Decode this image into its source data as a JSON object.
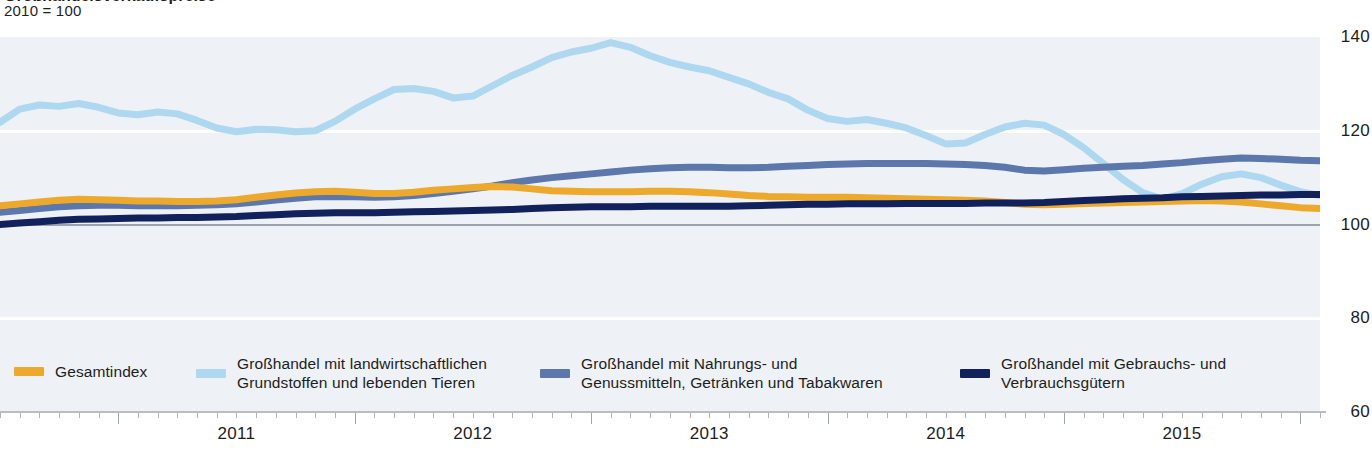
{
  "header": {
    "title_clipped": "Großhandelsverkaufspreise",
    "index_note": "2010 = 100"
  },
  "colors": {
    "gesamtindex": "#EDA92C",
    "agrar": "#ADD8EF",
    "nahrung": "#5C77AC",
    "gebrauch": "#11215C",
    "plot_band": "#eef1f5",
    "baseline": "#9aa3ab",
    "axis": "#b9bcc2"
  },
  "legend": [
    {
      "name": "legend-gesamtindex",
      "label": "Gesamtindex",
      "color": "#EDA92C"
    },
    {
      "name": "legend-agrar",
      "label": "Großhandel mit landwirtschaftlichen\nGrundstoffen und lebenden Tieren",
      "color": "#ADD8EF"
    },
    {
      "name": "legend-nahrung",
      "label": "Großhandel mit Nahrungs- und\nGenussmitteln, Getränken und Tabakwaren",
      "color": "#5C77AC"
    },
    {
      "name": "legend-gebrauch",
      "label": "Großhandel mit Gebrauchs- und\nVerbrauchsgütern",
      "color": "#11215C"
    }
  ],
  "chart_data": {
    "type": "line",
    "title": "Großhandelsverkaufspreise",
    "subtitle": "2010 = 100",
    "xlabel": "",
    "ylabel": "",
    "ylim": [
      60,
      140
    ],
    "yticks": [
      140,
      120,
      100,
      80,
      60
    ],
    "xticks": [
      2011,
      2012,
      2013,
      2014,
      2015
    ],
    "xtick_labels": [
      "2011",
      "2012",
      "2013",
      "2014",
      "2015"
    ],
    "x_start": "2010-07",
    "x_end": "2015-10",
    "x_resolution": "monthly",
    "grid": "horizontal-bands",
    "legend_position": "bottom",
    "series": [
      {
        "name": "Gesamtindex",
        "color": "#EDA92C",
        "values": [
          104.0,
          104.4,
          104.8,
          105.2,
          105.4,
          105.3,
          105.2,
          105.0,
          105.0,
          104.9,
          104.9,
          105.0,
          105.3,
          105.8,
          106.3,
          106.7,
          107.0,
          107.1,
          106.9,
          106.6,
          106.6,
          106.9,
          107.3,
          107.6,
          107.9,
          108.1,
          108.0,
          107.6,
          107.2,
          107.1,
          107.0,
          107.0,
          107.0,
          107.1,
          107.1,
          107.0,
          106.8,
          106.5,
          106.2,
          106.0,
          105.9,
          105.8,
          105.8,
          105.8,
          105.7,
          105.6,
          105.5,
          105.4,
          105.3,
          105.2,
          105.0,
          104.7,
          104.3,
          104.2,
          104.3,
          104.5,
          104.6,
          104.7,
          104.8,
          104.9,
          105.0,
          105.1,
          105.0,
          104.8,
          104.4,
          104.0,
          103.6,
          103.4
        ]
      },
      {
        "name": "Großhandel mit landwirtschaftlichen Grundstoffen und lebenden Tieren",
        "color": "#ADD8EF",
        "values": [
          121.8,
          124.6,
          125.5,
          125.2,
          125.8,
          125.0,
          123.8,
          123.4,
          124.0,
          123.6,
          122.2,
          120.6,
          119.8,
          120.3,
          120.2,
          119.8,
          120.0,
          122.0,
          124.6,
          126.8,
          128.8,
          129.0,
          128.4,
          127.0,
          127.4,
          129.6,
          131.8,
          133.6,
          135.6,
          136.8,
          137.6,
          138.8,
          137.8,
          136.0,
          134.6,
          133.6,
          132.8,
          131.4,
          130.0,
          128.2,
          126.8,
          124.4,
          122.6,
          122.0,
          122.4,
          121.6,
          120.6,
          119.0,
          117.2,
          117.4,
          119.2,
          120.8,
          121.6,
          121.2,
          119.2,
          116.4,
          113.0,
          109.6,
          106.8,
          105.4,
          106.6,
          108.6,
          110.2,
          110.8,
          110.0,
          108.4,
          107.0,
          106.2
        ]
      },
      {
        "name": "Großhandel mit Nahrungs- und Genussmitteln, Getränken und Tabakwaren",
        "color": "#5C77AC",
        "values": [
          102.6,
          103.0,
          103.4,
          103.8,
          104.0,
          104.1,
          104.1,
          104.0,
          104.0,
          104.0,
          104.1,
          104.2,
          104.4,
          104.8,
          105.2,
          105.6,
          105.9,
          106.0,
          105.9,
          105.8,
          105.9,
          106.2,
          106.6,
          107.1,
          107.6,
          108.2,
          108.9,
          109.5,
          110.0,
          110.4,
          110.8,
          111.2,
          111.6,
          111.9,
          112.1,
          112.2,
          112.2,
          112.1,
          112.1,
          112.2,
          112.4,
          112.6,
          112.8,
          112.9,
          113.0,
          113.0,
          113.0,
          113.0,
          112.9,
          112.8,
          112.6,
          112.2,
          111.6,
          111.4,
          111.7,
          112.0,
          112.2,
          112.4,
          112.6,
          112.9,
          113.2,
          113.6,
          113.9,
          114.2,
          114.1,
          113.9,
          113.7,
          113.6
        ]
      },
      {
        "name": "Großhandel mit Gebrauchs- und Verbrauchsgütern",
        "color": "#11215C",
        "values": [
          100.0,
          100.3,
          100.6,
          100.9,
          101.1,
          101.2,
          101.3,
          101.4,
          101.4,
          101.5,
          101.5,
          101.6,
          101.7,
          101.9,
          102.1,
          102.3,
          102.4,
          102.5,
          102.5,
          102.5,
          102.6,
          102.7,
          102.8,
          102.9,
          103.0,
          103.1,
          103.2,
          103.4,
          103.6,
          103.7,
          103.8,
          103.8,
          103.8,
          103.9,
          103.9,
          103.9,
          103.9,
          103.9,
          104.0,
          104.1,
          104.2,
          104.3,
          104.3,
          104.4,
          104.4,
          104.4,
          104.5,
          104.5,
          104.5,
          104.5,
          104.6,
          104.6,
          104.6,
          104.7,
          104.9,
          105.1,
          105.3,
          105.5,
          105.6,
          105.7,
          105.9,
          106.0,
          106.1,
          106.2,
          106.3,
          106.3,
          106.4,
          106.4
        ]
      }
    ]
  }
}
